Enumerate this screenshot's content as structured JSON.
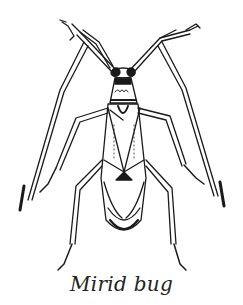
{
  "figure": {
    "caption": "Mirid bug",
    "colors": {
      "ink": "#1a1a1a",
      "background": "#ffffff"
    }
  }
}
